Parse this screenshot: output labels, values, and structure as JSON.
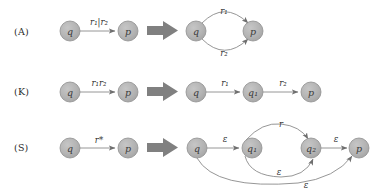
{
  "figure": {
    "background": "#ffffff",
    "node_fill": "#b3b3b3",
    "node_stroke": "#8c8c8c",
    "edge_color": "#8a8a8a",
    "block_arrow_color": "#808080",
    "text_color": "#2b2b2b"
  },
  "rows": [
    {
      "key": "A",
      "label": "(A)",
      "label_pos": {
        "x": 18,
        "y": 26
      },
      "left": {
        "nodes": [
          {
            "id": "q",
            "label": "q",
            "cx": 70,
            "cy": 31,
            "r": 10
          },
          {
            "id": "p",
            "label": "p",
            "cx": 128,
            "cy": 31,
            "r": 10
          }
        ],
        "edges": [
          {
            "from": "q",
            "to": "p",
            "label": "r₁|r₂",
            "label_x": 99,
            "label_y": 20
          }
        ]
      },
      "block_arrow": {
        "x": 147,
        "y": 22,
        "w": 31,
        "h": 17
      },
      "right": {
        "nodes": [
          {
            "id": "q",
            "label": "q",
            "cx": 196,
            "cy": 31,
            "r": 10
          },
          {
            "id": "p",
            "label": "p",
            "cx": 253,
            "cy": 31,
            "r": 10
          }
        ],
        "edges": [
          {
            "from": "q",
            "to": "p",
            "label": "r₁",
            "label_x": 224,
            "label_y": 10,
            "shape": "arc-up"
          },
          {
            "from": "q",
            "to": "p",
            "label": "r₂",
            "label_x": 224,
            "label_y": 58,
            "shape": "arc-down"
          }
        ]
      }
    },
    {
      "key": "K",
      "label": "(K)",
      "label_pos": {
        "x": 18,
        "y": 87
      },
      "left": {
        "nodes": [
          {
            "id": "q",
            "label": "q",
            "cx": 70,
            "cy": 92,
            "r": 10
          },
          {
            "id": "p",
            "label": "p",
            "cx": 128,
            "cy": 92,
            "r": 10
          }
        ],
        "edges": [
          {
            "from": "q",
            "to": "p",
            "label": "r₁r₂",
            "label_x": 99,
            "label_y": 81
          }
        ]
      },
      "block_arrow": {
        "x": 147,
        "y": 83,
        "w": 31,
        "h": 17
      },
      "right": {
        "nodes": [
          {
            "id": "q",
            "label": "q",
            "cx": 196,
            "cy": 92,
            "r": 10
          },
          {
            "id": "q1",
            "label": "q₁",
            "cx": 253,
            "cy": 92,
            "r": 10
          },
          {
            "id": "p",
            "label": "p",
            "cx": 311,
            "cy": 92,
            "r": 10
          }
        ],
        "edges": [
          {
            "from": "q",
            "to": "q1",
            "label": "r₁",
            "label_x": 225,
            "label_y": 81
          },
          {
            "from": "q1",
            "to": "p",
            "label": "r₂",
            "label_x": 283,
            "label_y": 81
          }
        ]
      }
    },
    {
      "key": "S",
      "label": "(S)",
      "label_pos": {
        "x": 18,
        "y": 143
      },
      "left": {
        "nodes": [
          {
            "id": "q",
            "label": "q",
            "cx": 70,
            "cy": 148,
            "r": 10
          },
          {
            "id": "p",
            "label": "p",
            "cx": 128,
            "cy": 148,
            "r": 10
          }
        ],
        "edges": [
          {
            "from": "q",
            "to": "p",
            "label": "r*",
            "label_x": 99,
            "label_y": 138
          }
        ]
      },
      "block_arrow": {
        "x": 147,
        "y": 140,
        "w": 31,
        "h": 17
      },
      "right": {
        "nodes": [
          {
            "id": "q",
            "label": "q",
            "cx": 197,
            "cy": 148,
            "r": 10
          },
          {
            "id": "q1",
            "label": "q₁",
            "cx": 252,
            "cy": 148,
            "r": 10
          },
          {
            "id": "q2",
            "label": "q₂",
            "cx": 311,
            "cy": 148,
            "r": 10
          },
          {
            "id": "p",
            "label": "p",
            "cx": 359,
            "cy": 148,
            "r": 10
          }
        ],
        "edges": [
          {
            "from": "q",
            "to": "q1",
            "label": "ε",
            "label_x": 225,
            "label_y": 138
          },
          {
            "from": "q1",
            "to": "q2",
            "label": "r",
            "label_x": 281,
            "label_y": 124,
            "shape": "arc-up"
          },
          {
            "from": "q2",
            "to": "q1",
            "label": "ε",
            "label_x": 279,
            "label_y": 172,
            "shape": "arc-down"
          },
          {
            "from": "q2",
            "to": "p",
            "label": "ε",
            "label_x": 336,
            "label_y": 138
          },
          {
            "from": "q",
            "to": "p",
            "label": "ε",
            "label_x": 306,
            "label_y": 185,
            "shape": "arc-wide"
          }
        ]
      }
    }
  ]
}
